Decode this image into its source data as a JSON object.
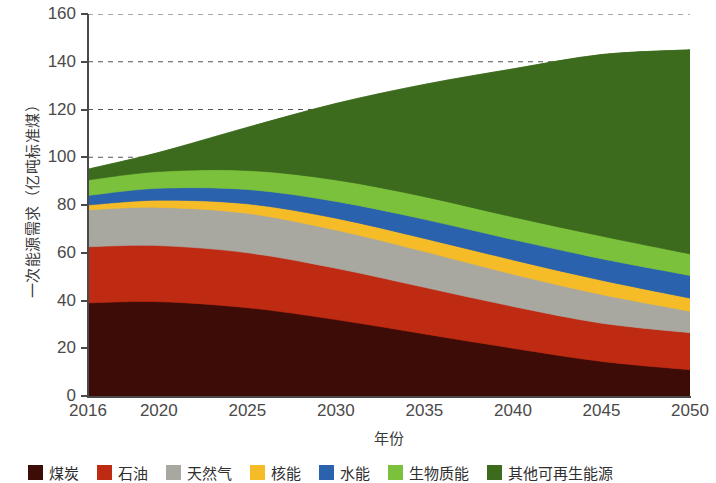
{
  "chart_data": {
    "type": "area",
    "stacked": true,
    "title": "",
    "xlabel": "年份",
    "ylabel": "一次能源需求（亿吨标准煤）",
    "x": [
      2016,
      2020,
      2025,
      2030,
      2035,
      2040,
      2045,
      2050
    ],
    "xticklabels": [
      "2016",
      "2020",
      "2025",
      "2030",
      "2035",
      "2040",
      "2045",
      "2050"
    ],
    "yticklabels": [
      "0",
      "20",
      "40",
      "60",
      "80",
      "100",
      "120",
      "140",
      "160"
    ],
    "yticks": [
      0,
      20,
      40,
      60,
      80,
      100,
      120,
      140,
      160
    ],
    "ylim": [
      0,
      160
    ],
    "grid": "horizontal-dashed",
    "legend_position": "bottom",
    "series": [
      {
        "name": "煤炭",
        "color": "#3D0C07",
        "values": [
          39.0,
          39.5,
          37.0,
          32.0,
          26.0,
          20.0,
          14.5,
          11.0
        ]
      },
      {
        "name": "石油",
        "color": "#BE2A12",
        "values": [
          23.5,
          23.5,
          23.0,
          21.5,
          19.5,
          17.5,
          16.0,
          15.5
        ]
      },
      {
        "name": "天然气",
        "color": "#A8A8A0",
        "values": [
          15.5,
          16.0,
          16.5,
          16.0,
          15.0,
          13.5,
          12.0,
          9.0
        ]
      },
      {
        "name": "核能",
        "color": "#F5BC28",
        "values": [
          2.0,
          3.0,
          4.0,
          5.0,
          5.5,
          6.0,
          6.0,
          5.5
        ]
      },
      {
        "name": "水能",
        "color": "#2A62AD",
        "values": [
          4.0,
          5.0,
          6.0,
          7.0,
          8.0,
          8.5,
          9.0,
          9.5
        ]
      },
      {
        "name": "生物质能",
        "color": "#7CC13C",
        "values": [
          6.5,
          7.0,
          8.0,
          9.0,
          9.5,
          9.5,
          9.5,
          9.0
        ]
      },
      {
        "name": "其他可再生能源",
        "color": "#3C6B1E",
        "values": [
          4.5,
          8.0,
          18.0,
          32.0,
          47.0,
          62.0,
          76.0,
          85.5
        ]
      }
    ]
  },
  "axes": {
    "y_title": "一次能源需求（亿吨标准煤）",
    "x_title": "年份"
  },
  "legend": {
    "items": [
      {
        "label": "煤炭",
        "color": "#3D0C07"
      },
      {
        "label": "石油",
        "color": "#BE2A12"
      },
      {
        "label": "天然气",
        "color": "#A8A8A0"
      },
      {
        "label": "核能",
        "color": "#F5BC28"
      },
      {
        "label": "水能",
        "color": "#2A62AD"
      },
      {
        "label": "生物质能",
        "color": "#7CC13C"
      },
      {
        "label": "其他可再生能源",
        "color": "#3C6B1E"
      }
    ]
  }
}
